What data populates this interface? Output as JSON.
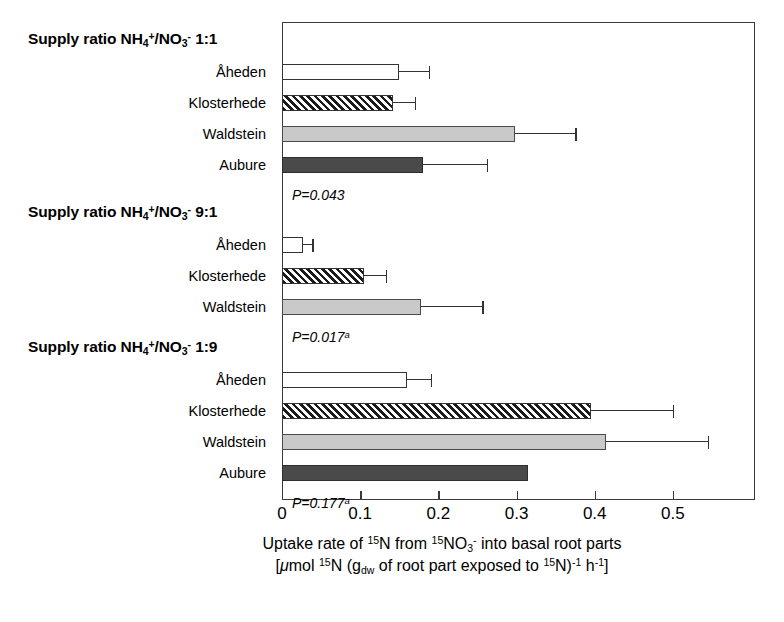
{
  "chart_data": {
    "type": "bar",
    "orientation": "horizontal",
    "title": "",
    "xlabel_line1": "Uptake rate of 15N from 15NO3- into basal root parts",
    "xlabel_line2": "[umol 15N (gdw of root part exposed to 15N)-1 h-1]",
    "xlim": [
      0,
      0.605
    ],
    "xticks": [
      0,
      0.1,
      0.2,
      0.3,
      0.4,
      0.5
    ],
    "xtick_labels": [
      "0",
      "0.1",
      "0.2",
      "0.3",
      "0.4",
      "0.5"
    ],
    "grid": false,
    "legend": "none",
    "categories": [
      "Åheden",
      "Klosterhede",
      "Waldstein",
      "Aubure"
    ],
    "groups": [
      {
        "header_prefix": "Supply ratio NH",
        "header_sub1": "4",
        "header_sup1": "+",
        "header_mid": "/NO",
        "header_sub2": "3",
        "header_sup2": "-",
        "header_ratio": "1:1",
        "pvalue_text": "P=0.043",
        "pvalue_sup": "",
        "bars": [
          {
            "label": "Åheden",
            "value": 0.15,
            "error": 0.038,
            "style": "white"
          },
          {
            "label": "Klosterhede",
            "value": 0.142,
            "error": 0.028,
            "style": "hatch"
          },
          {
            "label": "Waldstein",
            "value": 0.298,
            "error": 0.077,
            "style": "lightgrey"
          },
          {
            "label": "Aubure",
            "value": 0.18,
            "error": 0.082,
            "style": "darkgrey"
          }
        ]
      },
      {
        "header_prefix": "Supply ratio NH",
        "header_sub1": "4",
        "header_sup1": "+",
        "header_mid": "/NO",
        "header_sub2": "3",
        "header_sup2": "-",
        "header_ratio": "9:1",
        "pvalue_text": "P=0.017",
        "pvalue_sup": "a",
        "bars": [
          {
            "label": "Åheden",
            "value": 0.027,
            "error": 0.012,
            "style": "white"
          },
          {
            "label": "Klosterhede",
            "value": 0.105,
            "error": 0.028,
            "style": "hatch"
          },
          {
            "label": "Waldstein",
            "value": 0.178,
            "error": 0.078,
            "style": "lightgrey"
          }
        ]
      },
      {
        "header_prefix": "Supply ratio NH",
        "header_sub1": "4",
        "header_sup1": "+",
        "header_mid": "/NO",
        "header_sub2": "3",
        "header_sup2": "-",
        "header_ratio": "1:9",
        "pvalue_text": "P=0.177",
        "pvalue_sup": "a",
        "bars": [
          {
            "label": "Åheden",
            "value": 0.16,
            "error": 0.03,
            "style": "white"
          },
          {
            "label": "Klosterhede",
            "value": 0.395,
            "error": 0.105,
            "style": "hatch"
          },
          {
            "label": "Waldstein",
            "value": 0.415,
            "error": 0.13,
            "style": "lightgrey"
          },
          {
            "label": "Aubure",
            "value": 0.315,
            "error": 0.0,
            "style": "darkgrey"
          }
        ]
      }
    ]
  }
}
